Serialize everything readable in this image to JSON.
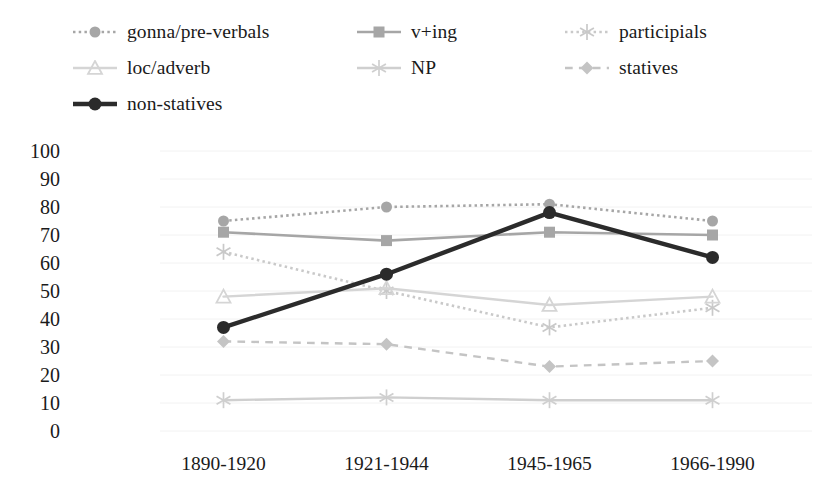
{
  "chart_data": {
    "type": "line",
    "title": "",
    "xlabel": "",
    "ylabel": "",
    "categories": [
      "1890-1920",
      "1921-1944",
      "1945-1965",
      "1966-1990"
    ],
    "ylim": [
      0,
      100
    ],
    "ytick_step": 10,
    "yticks": [
      "100",
      "90",
      "80",
      "70",
      "60",
      "50",
      "40",
      "30",
      "20",
      "10",
      "0"
    ],
    "grid": "horizontal-light",
    "legend_position": "top",
    "series": [
      {
        "name": "gonna/pre-verbals",
        "values": [
          75,
          80,
          81,
          75
        ],
        "color": "#a6a6a6",
        "line_style": "dotted",
        "marker": "circle",
        "line_width": 2.6
      },
      {
        "name": "v+ing",
        "values": [
          71,
          68,
          71,
          70
        ],
        "color": "#a6a6a6",
        "line_style": "solid",
        "marker": "square",
        "line_width": 2.6
      },
      {
        "name": "participials",
        "values": [
          64,
          50,
          37,
          44
        ],
        "color": "#c9c9c9",
        "line_style": "dotted",
        "marker": "asterisk",
        "line_width": 2.6
      },
      {
        "name": "loc/adverb",
        "values": [
          48,
          51,
          45,
          48
        ],
        "color": "#d5d5d5",
        "line_style": "solid",
        "marker": "triangle",
        "line_width": 2.4
      },
      {
        "name": "NP",
        "values": [
          11,
          12,
          11,
          11
        ],
        "color": "#cfcfcf",
        "line_style": "solid",
        "marker": "asterisk",
        "line_width": 2.4
      },
      {
        "name": "statives",
        "values": [
          32,
          31,
          23,
          25
        ],
        "color": "#c4c4c4",
        "line_style": "dashed",
        "marker": "diamond",
        "line_width": 2.4
      },
      {
        "name": "non-statives",
        "values": [
          37,
          56,
          78,
          62
        ],
        "color": "#2b2b2b",
        "line_style": "solid",
        "marker": "circle",
        "line_width": 4.4
      }
    ]
  },
  "legend": {
    "entries": [
      {
        "label": "gonna/pre-verbals",
        "column": 0,
        "row": 0
      },
      {
        "label": "v+ing",
        "column": 1,
        "row": 0
      },
      {
        "label": "participials",
        "column": 2,
        "row": 0
      },
      {
        "label": "loc/adverb",
        "column": 0,
        "row": 1
      },
      {
        "label": "NP",
        "column": 1,
        "row": 1
      },
      {
        "label": "statives",
        "column": 2,
        "row": 1
      },
      {
        "label": "non-statives",
        "column": 0,
        "row": 2
      }
    ]
  }
}
